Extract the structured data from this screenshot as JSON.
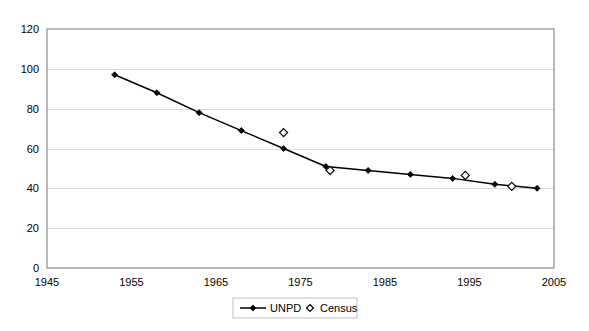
{
  "chart_data": {
    "type": "line",
    "title": "",
    "subtitle": "",
    "xlabel": "",
    "ylabel": "",
    "xlim": [
      1945,
      2005
    ],
    "ylim": [
      0,
      120
    ],
    "x_ticks": [
      1945,
      1955,
      1965,
      1975,
      1985,
      1995,
      2005
    ],
    "y_ticks": [
      0,
      20,
      40,
      60,
      80,
      100,
      120
    ],
    "grid": "horizontal",
    "legend_position": "bottom-center",
    "series": [
      {
        "name": "UNPD",
        "marker": "filled-diamond",
        "line": true,
        "x": [
          1953,
          1958,
          1963,
          1968,
          1973,
          1978,
          1983,
          1988,
          1993,
          1998,
          2003
        ],
        "values": [
          97,
          88,
          78,
          69,
          60,
          51,
          49,
          47,
          45,
          42,
          40
        ]
      },
      {
        "name": "Census",
        "marker": "open-diamond",
        "line": false,
        "x": [
          1973,
          1978.5,
          1994.5,
          2000
        ],
        "values": [
          68,
          49,
          46.5,
          41
        ]
      }
    ]
  },
  "legend": {
    "items": [
      {
        "label": "UNPD",
        "marker": "filled-diamond-with-line"
      },
      {
        "label": "Census",
        "marker": "open-diamond"
      }
    ]
  },
  "axes": {
    "y_tick_labels": [
      "0",
      "20",
      "40",
      "60",
      "80",
      "100",
      "120"
    ],
    "x_tick_labels": [
      "1945",
      "1955",
      "1965",
      "1975",
      "1985",
      "1995",
      "2005"
    ]
  }
}
